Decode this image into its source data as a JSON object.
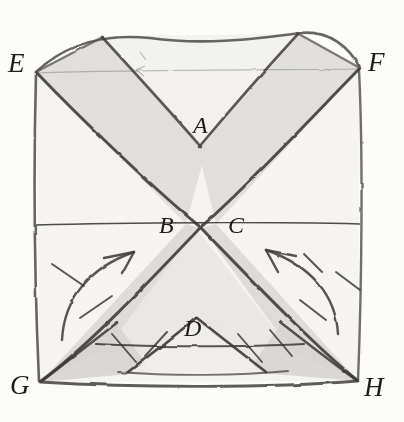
{
  "figure": {
    "kind": "hand-drawn geometric fold diagram",
    "labels": {
      "A": "A",
      "B": "B",
      "C": "C",
      "D": "D",
      "E": "E",
      "F": "F",
      "G": "G",
      "H": "H"
    },
    "colors": {
      "paper": "#fdfdfc",
      "ink": "#4a4744",
      "ink_dark": "#262320",
      "shade_light": "#f0efed",
      "shade_mid": "#e3e2df",
      "shade_dark": "#d6d5d1"
    },
    "geometry": {
      "square_corners": {
        "E": [
          36,
          72
        ],
        "F": [
          360,
          68
        ],
        "G": [
          40,
          382
        ],
        "H": [
          358,
          381
        ]
      },
      "inner_points": {
        "A": [
          200,
          148
        ],
        "B": [
          186,
          224
        ],
        "C": [
          216,
          224
        ],
        "D": [
          196,
          346
        ]
      },
      "horizontal_line_y": 224
    },
    "annotations": [
      "curved arrow lower-left pointing up toward B",
      "curved arrow lower-right pointing up toward C",
      "tick hatch marks along lower-left fold",
      "tick hatch marks along lower-right fold"
    ]
  }
}
